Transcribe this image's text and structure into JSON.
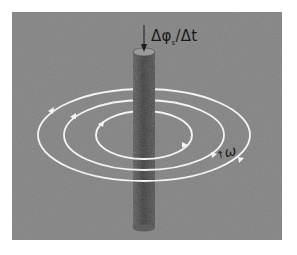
{
  "diagram": {
    "colors": {
      "page_background": "#ffffff",
      "panel_background": "#8e8e8e",
      "rod_fill": "#555555",
      "field_lines": "#f4f4f4",
      "text": "#1a1a1a"
    },
    "labels": {
      "flux_rate_main": "Δφ",
      "flux_rate_sub": "s",
      "flux_rate_tail": "/Δt",
      "omega_arrow": "↑",
      "omega": "ω"
    },
    "field_lines": [
      {
        "name": "inner",
        "rx": 48,
        "ry": 24,
        "arrows": 2
      },
      {
        "name": "middle",
        "rx": 80,
        "ry": 35,
        "arrows": 2
      },
      {
        "name": "outer",
        "rx": 106,
        "ry": 46,
        "arrows": 2
      }
    ]
  }
}
